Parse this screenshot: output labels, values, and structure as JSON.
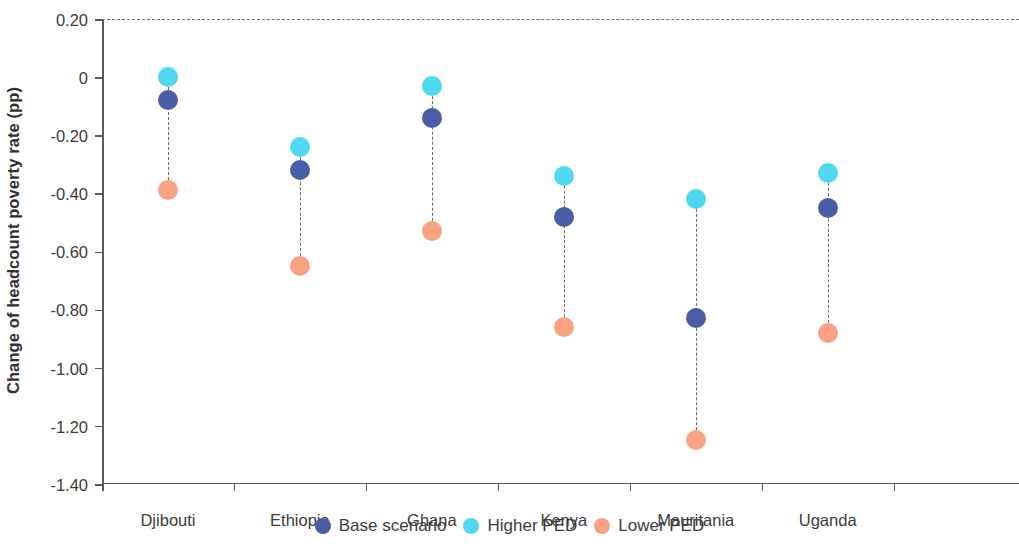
{
  "chart_data": {
    "type": "scatter",
    "title": "",
    "xlabel": "",
    "ylabel": "Change of headcount poverty rate (pp)",
    "categories": [
      "Djibouti",
      "Ethiopia",
      "Ghana",
      "Kenya",
      "Mauritania",
      "Uganda"
    ],
    "ylim": [
      -1.4,
      0.2
    ],
    "ytick_labels": [
      "0.20",
      "0",
      "-0.20",
      "-0.40",
      "-0.60",
      "-0.80",
      "-1.00",
      "-1.20",
      "-1.40"
    ],
    "ytick_values": [
      0.2,
      0,
      -0.2,
      -0.4,
      -0.6,
      -0.8,
      -1.0,
      -1.2,
      -1.4
    ],
    "grid": false,
    "zero_reference_line": 0,
    "legend_position": "bottom",
    "series": [
      {
        "name": "Base scenario",
        "key": "base",
        "color": "#4a5ea8",
        "values": [
          -0.08,
          -0.32,
          -0.14,
          -0.48,
          -0.83,
          -0.45
        ]
      },
      {
        "name": "Higher PED",
        "key": "higher",
        "color": "#4fd8f2",
        "values": [
          0.0,
          -0.24,
          -0.03,
          -0.34,
          -0.42,
          -0.33
        ]
      },
      {
        "name": "Lower PED",
        "key": "lower",
        "color": "#f8a183",
        "values": [
          -0.39,
          -0.65,
          -0.53,
          -0.86,
          -1.25,
          -0.88
        ]
      }
    ]
  }
}
